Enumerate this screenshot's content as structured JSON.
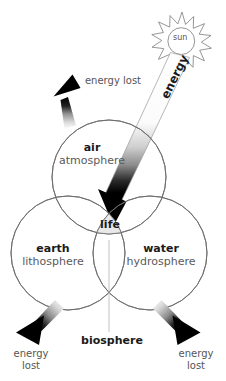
{
  "diagram": {
    "title": "biosphere",
    "sun": {
      "label": "sun",
      "icon": "sun-icon"
    },
    "beam": {
      "label": "energy"
    },
    "center": {
      "label": "life",
      "fill": "#e8e8e8"
    },
    "spheres": [
      {
        "id": "air",
        "name": "air",
        "sub": "atmosphere"
      },
      {
        "id": "earth",
        "name": "earth",
        "sub": "lithosphere"
      },
      {
        "id": "water",
        "name": "water",
        "sub": "hydrosphere"
      }
    ],
    "energy_lost": [
      {
        "id": "top",
        "line1": "energy lost",
        "line2": ""
      },
      {
        "id": "bottom-left",
        "line1": "energy",
        "line2": "lost"
      },
      {
        "id": "bottom-right",
        "line1": "energy",
        "line2": "lost"
      }
    ],
    "colors": {
      "stroke": "#6b6b6b",
      "arrow": "#000000",
      "life_fill": "#e8e8e8",
      "text": "#1a1a1a",
      "subtext": "#5a5a5a",
      "background": "#ffffff"
    }
  }
}
